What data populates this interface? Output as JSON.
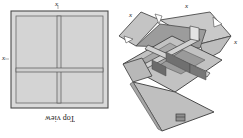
{
  "figure": {
    "panels": [
      {
        "id": "top-view",
        "caption": "Top view",
        "labels": {
          "top": "x",
          "left": "x"
        }
      },
      {
        "id": "isometric-box",
        "labels": {
          "left_flap": "x",
          "top_flap": "x",
          "right_flap": "x"
        }
      }
    ]
  },
  "colors": {
    "paper": "#ffffff",
    "panel_fill": "#d9d9d9",
    "light_fill": "#c9c9c9",
    "mid_fill": "#b3b3b3",
    "shade_fill": "#8a8a8a",
    "dark_fill": "#6f6f6f",
    "stroke": "#3b3b3b",
    "text": "#1a1a1a"
  }
}
